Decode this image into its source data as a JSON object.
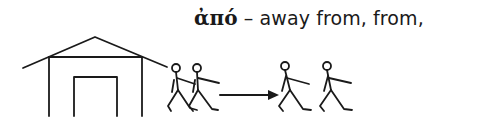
{
  "caption": {
    "greek_word": "ἀπό",
    "separator": " – ",
    "gloss": "away from, from,"
  },
  "illustration": {
    "description": "Stick figures walking away from a house, arrow pointing right",
    "stroke_color": "#1a1a1a",
    "elements": [
      "house",
      "walkers-left-pair",
      "arrow-right",
      "walkers-right-pair"
    ]
  }
}
